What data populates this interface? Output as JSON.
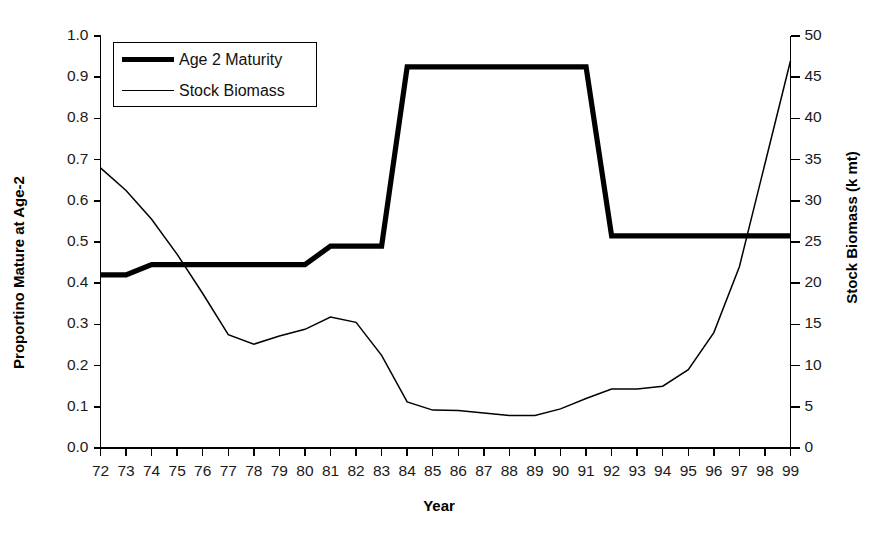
{
  "chart_data": {
    "type": "line",
    "title": "",
    "xlabel": "Year",
    "ylabel": "Proportino Mature at Age-2",
    "ylabel_right": "Stock Biomass (k mt)",
    "grid": false,
    "legend_position": "top-left",
    "x": [
      "72",
      "73",
      "74",
      "75",
      "76",
      "77",
      "78",
      "79",
      "80",
      "81",
      "82",
      "83",
      "84",
      "85",
      "86",
      "87",
      "88",
      "89",
      "90",
      "91",
      "92",
      "93",
      "94",
      "95",
      "96",
      "97",
      "98",
      "99"
    ],
    "xlim": [
      72,
      99
    ],
    "ylim": [
      0.0,
      1.0
    ],
    "yticks": [
      "0.0",
      "0.1",
      "0.2",
      "0.3",
      "0.4",
      "0.5",
      "0.6",
      "0.7",
      "0.8",
      "0.9",
      "1.0"
    ],
    "ylim_right": [
      0,
      50
    ],
    "yticks_right": [
      "0",
      "5",
      "10",
      "15",
      "20",
      "25",
      "30",
      "35",
      "40",
      "45",
      "50"
    ],
    "series": [
      {
        "name": "Age 2 Maturity",
        "axis": "left",
        "style": "thick",
        "color": "#000000",
        "values": [
          0.42,
          0.42,
          0.445,
          0.445,
          0.445,
          0.445,
          0.445,
          0.445,
          0.445,
          0.49,
          0.49,
          0.49,
          0.925,
          0.925,
          0.925,
          0.925,
          0.925,
          0.925,
          0.925,
          0.925,
          0.515,
          0.515,
          0.515,
          0.515,
          0.515,
          0.515,
          0.515,
          0.515
        ]
      },
      {
        "name": "Stock Biomass",
        "axis": "right",
        "style": "thin",
        "color": "#000000",
        "values_left_scale": [
          0.68,
          0.625,
          0.555,
          0.47,
          0.375,
          0.275,
          0.252,
          0.272,
          0.288,
          0.318,
          0.305,
          0.225,
          0.112,
          0.092,
          0.091,
          0.085,
          0.079,
          0.079,
          0.095,
          0.12,
          0.143,
          0.143,
          0.15,
          0.19,
          0.28,
          0.44,
          0.69,
          0.94
        ],
        "values": [
          34.0,
          31.2,
          27.8,
          23.5,
          18.8,
          13.8,
          12.6,
          13.6,
          14.4,
          15.9,
          15.3,
          11.3,
          5.6,
          4.6,
          4.6,
          4.3,
          4.0,
          4.0,
          4.8,
          6.0,
          7.2,
          7.2,
          7.5,
          9.5,
          14.0,
          22.0,
          34.5,
          47.0
        ]
      }
    ]
  },
  "legend": {
    "items": [
      {
        "label": "Age 2 Maturity",
        "style": "thick"
      },
      {
        "label": "Stock Biomass",
        "style": "thin"
      }
    ]
  }
}
